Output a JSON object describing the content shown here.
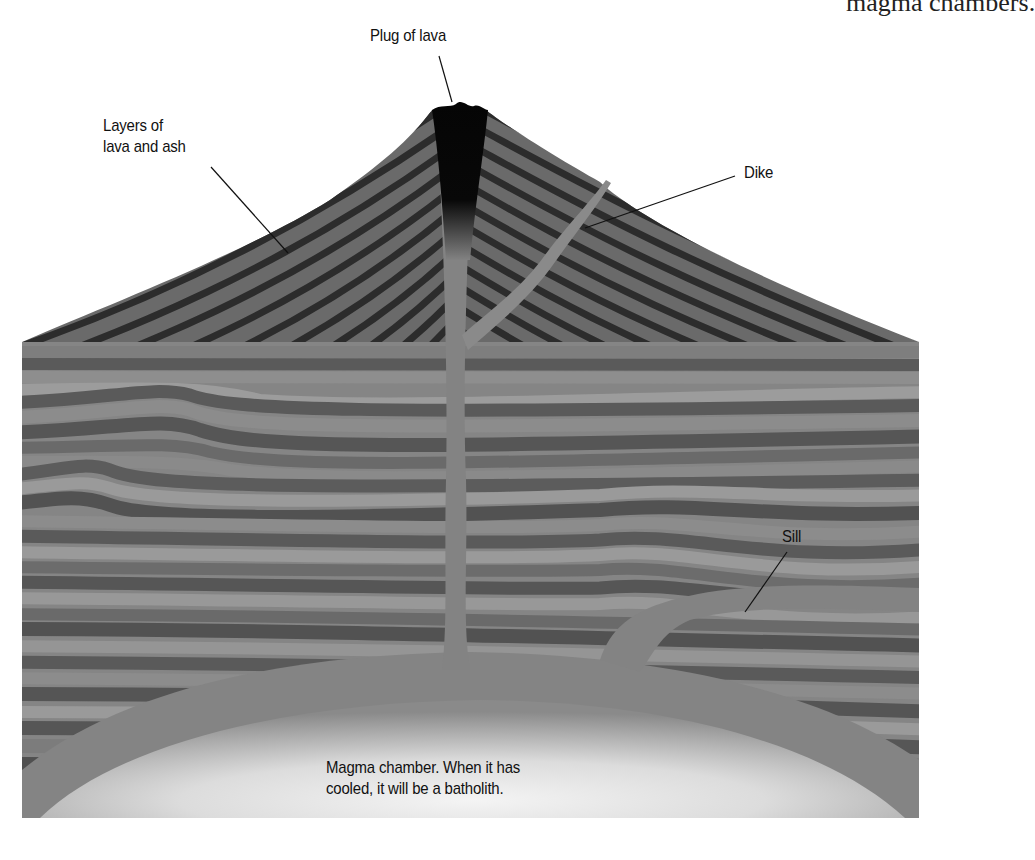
{
  "heading_fragment": "magma chambers.",
  "diagram": {
    "labels": {
      "plug": "Plug of lava",
      "layers_line1": "Layers of",
      "layers_line2": "lava and ash",
      "dike": "Dike",
      "sill": "Sill",
      "chamber_line1": "Magma chamber. When it has",
      "chamber_line2": "cooled, it will be a batholith."
    },
    "colors": {
      "plug": "#050505",
      "cone_dark": "#2e2e2e",
      "cone_light": "#6e6e6e",
      "strata_dark": "#555555",
      "strata_mid": "#7a7a7a",
      "strata_light": "#999999",
      "intrusion": "#828282",
      "chamber_center": "#f2f2f2",
      "chamber_edge": "#8c8c8c",
      "leader": "#111111"
    }
  }
}
